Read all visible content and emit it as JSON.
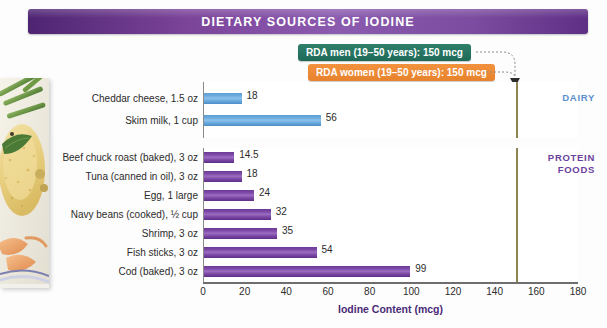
{
  "title": "DIETARY SOURCES OF IODINE",
  "callouts": [
    {
      "id": "rda-men",
      "label": "RDA men (19–50 years): 150 mcg",
      "color": "#1f6a58",
      "value": 150
    },
    {
      "id": "rda-women",
      "label": "RDA women (19–50 years): 150 mcg",
      "color": "#e8822c",
      "value": 150
    }
  ],
  "groups": [
    {
      "id": "dairy",
      "label": "DAIRY",
      "color": "#5a8fd0"
    },
    {
      "id": "protein",
      "label": "PROTEIN\nFOODS",
      "color": "#6b3f9e"
    }
  ],
  "group_labels": {
    "dairy": "DAIRY",
    "protein_line1": "PROTEIN",
    "protein_line2": "FOODS"
  },
  "photo": {
    "alt": "breaded baked fish with green beans and shrimp on a plate"
  },
  "chart_data": {
    "type": "bar",
    "orientation": "horizontal",
    "title": "DIETARY SOURCES OF IODINE",
    "xlabel": "Iodine Content (mcg)",
    "ylabel": "",
    "xlim": [
      0,
      180
    ],
    "xticks": [
      0,
      20,
      40,
      60,
      80,
      100,
      120,
      140,
      160,
      180
    ],
    "grid": false,
    "legend": "none",
    "reference_lines": [
      {
        "label": "RDA men (19–50 years): 150 mcg",
        "value": 150,
        "color": "#1f6a58"
      },
      {
        "label": "RDA women (19–50 years): 150 mcg",
        "value": 150,
        "color": "#e8822c"
      }
    ],
    "panels": [
      {
        "name": "DAIRY",
        "color": "#6aa9dd",
        "categories": [
          "Cheddar cheese, 1.5 oz",
          "Skim milk, 1 cup"
        ],
        "values": [
          18,
          56
        ],
        "value_labels": [
          "18",
          "56"
        ]
      },
      {
        "name": "PROTEIN FOODS",
        "color": "#7b47a5",
        "categories": [
          "Beef chuck roast (baked), 3 oz",
          "Tuna (canned in oil), 3 oz",
          "Egg, 1 large",
          "Navy beans (cooked), ½ cup",
          "Shrimp, 3 oz",
          "Fish sticks, 3 oz",
          "Cod (baked), 3 oz"
        ],
        "values": [
          14.5,
          18,
          24,
          32,
          35,
          54,
          99
        ],
        "value_labels": [
          "14.5",
          "18",
          "24",
          "32",
          "35",
          "54",
          "99"
        ]
      }
    ]
  }
}
